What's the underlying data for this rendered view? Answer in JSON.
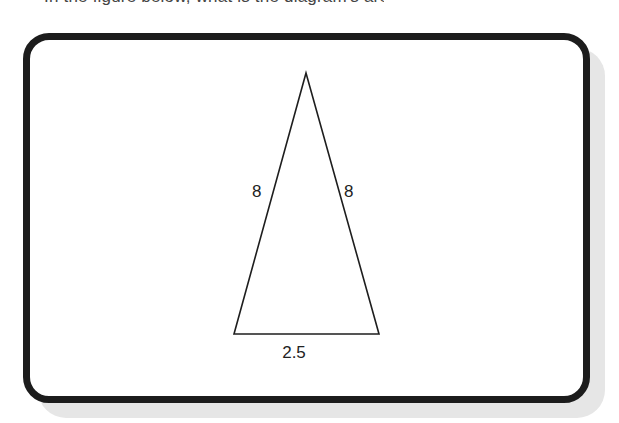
{
  "caption": {
    "text": "In the figure below, what is the diagram's area?"
  },
  "figure": {
    "shape": "isosceles-triangle",
    "stroke_color": "#1e1e1e",
    "frame_border_color": "#1c1c1c",
    "shadow_color": "#e6e6e6",
    "vertices": {
      "apex": [
        306,
        73
      ],
      "bottom_left": [
        234,
        334
      ],
      "bottom_right": [
        379,
        334
      ]
    },
    "labels": {
      "left_side": "8",
      "right_side": "8",
      "base": "2.5"
    }
  }
}
